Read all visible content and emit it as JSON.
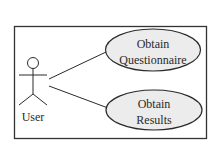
{
  "diagram": {
    "type": "UML use case diagram",
    "colors": {
      "background": "#ffffff",
      "stroke": "#333333",
      "ellipse_fill": "#ececec",
      "text": "#2a2a2a"
    },
    "actor": {
      "label": "User"
    },
    "use_cases": [
      {
        "line1": "Obtain",
        "line2": "Questionnaire"
      },
      {
        "line1": "Obtain",
        "line2": "Results"
      }
    ],
    "associations": [
      {
        "from": "User",
        "to": "Obtain Questionnaire"
      },
      {
        "from": "User",
        "to": "Obtain Results"
      }
    ]
  }
}
